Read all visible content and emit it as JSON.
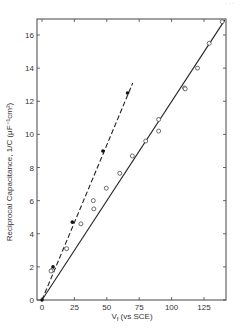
{
  "page": {
    "corner_mark": "· · ·"
  },
  "chart_data": {
    "type": "scatter",
    "title": "",
    "xlabel": "V_f (vs SCE)",
    "xlabel_main": "V",
    "xlabel_sub": "f",
    "xlabel_rest": " (vs SCE)",
    "ylabel": "Reciprocal Capacitance, 1/C (μF⁻¹cm²)",
    "xlim": [
      -4,
      142
    ],
    "ylim": [
      0,
      17
    ],
    "x_ticks": [
      0,
      25,
      50,
      75,
      100,
      125
    ],
    "y_ticks": [
      0,
      2,
      4,
      6,
      8,
      10,
      12,
      14,
      16
    ],
    "grid": false,
    "legend": null,
    "series": [
      {
        "name": "filled points (dashed fit)",
        "marker": "filled-circle",
        "line": "dashed",
        "points": [
          [
            0,
            0
          ],
          [
            8.5,
            2.0
          ],
          [
            23.4,
            4.7
          ],
          [
            47,
            9.0
          ],
          [
            66,
            12.5
          ]
        ],
        "fit_line": [
          [
            0,
            0
          ],
          [
            70,
            13.1
          ]
        ]
      },
      {
        "name": "open points (solid fit)",
        "marker": "open-circle",
        "line": "solid",
        "points": [
          [
            8,
            1.8
          ],
          [
            7,
            1.75
          ],
          [
            19,
            3.1
          ],
          [
            30,
            4.6
          ],
          [
            39.6,
            6.0
          ],
          [
            40,
            5.5
          ],
          [
            49.6,
            6.75
          ],
          [
            60,
            7.65
          ],
          [
            69.7,
            8.7
          ],
          [
            80,
            9.6
          ],
          [
            90,
            10.2
          ],
          [
            90,
            10.9
          ],
          [
            110,
            12.8
          ],
          [
            110.5,
            12.75
          ],
          [
            120,
            14.0
          ],
          [
            129,
            15.5
          ],
          [
            139,
            16.8
          ]
        ],
        "fit_line": [
          [
            0,
            0
          ],
          [
            141,
            16.9
          ]
        ]
      }
    ]
  }
}
